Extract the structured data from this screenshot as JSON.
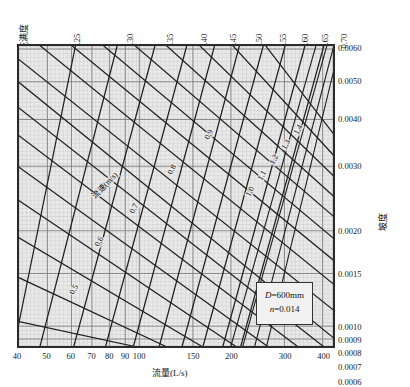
{
  "chart_data": {
    "type": "line",
    "title": "",
    "subtitle": "",
    "xlabel": "流量(L/s)",
    "ylabel": "坡度",
    "top_axis_label": "充满度",
    "top_axis_symbol_num": "h",
    "top_axis_symbol_den": "d",
    "diagonal_family_label": "流速(m/s)",
    "grid": true,
    "legend_position": "inside-lower-right",
    "xscale": "log",
    "yscale": "log",
    "xlim": [
      35,
      450
    ],
    "ylim": [
      0.0006,
      0.0062
    ],
    "x_ticks": [
      "40",
      "50",
      "60",
      "70",
      "80",
      "90",
      "100",
      "150",
      "200",
      "300",
      "400"
    ],
    "x_tick_values": [
      40,
      50,
      60,
      70,
      80,
      90,
      100,
      150,
      200,
      300,
      400
    ],
    "y_ticks_right": [
      "0.0060",
      "0.0050",
      "0.0040",
      "0.0030",
      "0.0020",
      "0.0015",
      "0.0010",
      "0.0009",
      "0.0008",
      "0.0007",
      "0.0006"
    ],
    "y_tick_values": [
      0.006,
      0.005,
      0.004,
      0.003,
      0.002,
      0.0015,
      0.001,
      0.0009,
      0.0008,
      0.0007,
      0.0006
    ],
    "top_ticks": [
      "0.25",
      "0.30",
      "0.35",
      "0.40",
      "0.45",
      "0.50",
      "0.55",
      "0.60",
      "0.65",
      "0.70"
    ],
    "top_tick_values": [
      0.25,
      0.3,
      0.35,
      0.4,
      0.45,
      0.5,
      0.55,
      0.6,
      0.65,
      0.7
    ],
    "velocity_labels": [
      "0.5",
      "0.6",
      "0.7",
      "0.8",
      "0.9",
      "1.0",
      "1.1",
      "1.2",
      "1.3",
      "1.4"
    ],
    "velocity_values": [
      0.5,
      0.6,
      0.7,
      0.8,
      0.9,
      1.0,
      1.1,
      1.2,
      1.3,
      1.4
    ],
    "series": [
      {
        "name": "充满度 h/d",
        "values": [
          0.25,
          0.3,
          0.35,
          0.4,
          0.45,
          0.5,
          0.55,
          0.6,
          0.65,
          0.7
        ]
      },
      {
        "name": "流速 v (m/s)",
        "values": [
          0.5,
          0.6,
          0.7,
          0.8,
          0.9,
          1.0,
          1.1,
          1.2,
          1.3,
          1.4
        ]
      }
    ],
    "annotations": [
      {
        "text": "D=600mm"
      },
      {
        "text": "n=0.014"
      }
    ]
  },
  "axes": {
    "bottom_title": "流量(L/s)",
    "right_title": "坡度",
    "top_title": "充满度",
    "top_title_num": "h",
    "top_title_den": "d"
  },
  "ticks": {
    "bottom": [
      {
        "label": "40",
        "x": 0
      },
      {
        "label": "50",
        "x": 29.6
      },
      {
        "label": "60",
        "x": 53.8
      },
      {
        "label": "70",
        "x": 74.4
      },
      {
        "label": "80",
        "x": 92.2
      },
      {
        "label": "90",
        "x": 108.0
      },
      {
        "label": "100",
        "x": 122.1
      },
      {
        "label": "150",
        "x": 176.0
      },
      {
        "label": "200",
        "x": 214.3
      },
      {
        "label": "300",
        "x": 268.2
      },
      {
        "label": "400",
        "x": 306.5
      }
    ],
    "right": [
      {
        "label": "0.0060",
        "y": 4
      },
      {
        "label": "0.0050",
        "y": 37
      },
      {
        "label": "0.0040",
        "y": 75
      },
      {
        "label": "0.0030",
        "y": 122
      },
      {
        "label": "0.0020",
        "y": 187
      },
      {
        "label": "0.0015",
        "y": 230
      },
      {
        "label": "0.0010",
        "y": 283
      },
      {
        "label": "0.0009",
        "y": 296
      },
      {
        "label": "0.0008",
        "y": 309
      },
      {
        "label": "0.0007",
        "y": 323
      },
      {
        "label": "0.0006",
        "y": 338
      }
    ],
    "top": [
      {
        "label": "0.25",
        "x": 67
      },
      {
        "label": "0.30",
        "x": 120
      },
      {
        "label": "0.35",
        "x": 160
      },
      {
        "label": "0.40",
        "x": 194
      },
      {
        "label": "0.45",
        "x": 223
      },
      {
        "label": "0.50",
        "x": 249
      },
      {
        "label": "0.55",
        "x": 273
      },
      {
        "label": "0.60",
        "x": 295
      },
      {
        "label": "0.65",
        "x": 315
      },
      {
        "label": "0.70",
        "x": 334
      }
    ]
  },
  "inplot_labels": {
    "velocity_family": "流速(m/s)",
    "velocity": [
      {
        "label": "0.5",
        "x": 50,
        "y": 248
      },
      {
        "label": "0.6",
        "x": 75,
        "y": 200
      },
      {
        "label": "0.7",
        "x": 110,
        "y": 167
      },
      {
        "label": "0.8",
        "x": 148,
        "y": 128
      },
      {
        "label": "0.9",
        "x": 185,
        "y": 93
      },
      {
        "label": "1.0",
        "x": 226,
        "y": 150
      },
      {
        "label": "1.1",
        "x": 238,
        "y": 134
      },
      {
        "label": "1.2",
        "x": 250,
        "y": 118
      },
      {
        "label": "1.3",
        "x": 262,
        "y": 103
      },
      {
        "label": "1.4",
        "x": 274,
        "y": 88
      }
    ]
  },
  "info_box": {
    "diameter_symbol": "D",
    "diameter_value": "=600mm",
    "roughness_symbol": "n",
    "roughness_value": "=0.014",
    "line1": "D=600mm",
    "line2": "n=0.014"
  },
  "colors": {
    "background": "#ffffff",
    "plot_bg": "#e9e9e9",
    "grid_minor": "#bbbbbb",
    "grid_major": "#8d8d8d",
    "curve": "#1a1a1a",
    "text": "#111111",
    "frame": "#2b2b2b"
  }
}
